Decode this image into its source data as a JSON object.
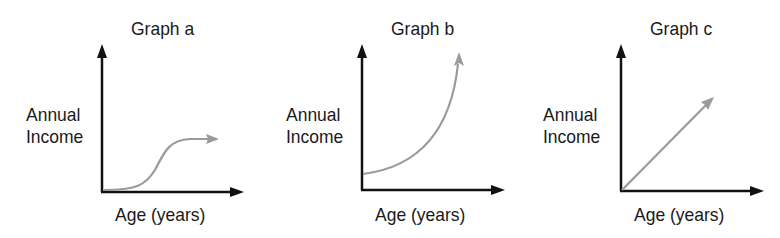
{
  "graphs": [
    {
      "id": "a",
      "title": "Graph a",
      "ylabel_line1": "Annual",
      "ylabel_line2": "Income",
      "xlabel": "Age (years)",
      "curve": "s-curve (slow start, steep rise, plateau)"
    },
    {
      "id": "b",
      "title": "Graph b",
      "ylabel_line1": "Annual",
      "ylabel_line2": "Income",
      "xlabel": "Age (years)",
      "curve": "exponential growth (starts above zero)"
    },
    {
      "id": "c",
      "title": "Graph c",
      "ylabel_line1": "Annual",
      "ylabel_line2": "Income",
      "xlabel": "Age (years)",
      "curve": "linear increase from origin"
    }
  ],
  "colors": {
    "axis": "#111111",
    "curve": "#9a9a9a",
    "text": "#1a1a1a",
    "background": "#ffffff"
  }
}
